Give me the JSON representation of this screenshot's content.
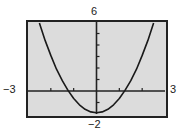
{
  "chart_data": {
    "type": "line",
    "title": "",
    "xlabel": "",
    "ylabel": "",
    "xlim": [
      -3,
      3
    ],
    "ylim": [
      -2,
      6
    ],
    "x_tick_step": 1,
    "y_tick_step": 1,
    "grid": false,
    "legend": null,
    "window_labels": {
      "xmin": "−3",
      "xmax": "3",
      "ymin": "−2",
      "ymax": "6"
    },
    "series": [
      {
        "name": "parabola",
        "description": "Upward-opening parabola, vertex near (0, -1.9), x-intercepts near ±1.23, exits top of window near x = ±2.5",
        "x": [
          -2.5,
          -2.25,
          -2.0,
          -1.75,
          -1.5,
          -1.25,
          -1.0,
          -0.75,
          -0.5,
          -0.25,
          0.0,
          0.25,
          0.5,
          0.75,
          1.0,
          1.25,
          1.5,
          1.75,
          2.0,
          2.25,
          2.5
        ],
        "y": [
          5.9,
          4.4,
          3.1,
          1.9,
          0.9,
          0.05,
          -0.65,
          -1.2,
          -1.59,
          -1.82,
          -1.9,
          -1.82,
          -1.59,
          -1.2,
          -0.65,
          0.05,
          0.9,
          1.9,
          3.1,
          4.4,
          5.9
        ]
      }
    ]
  },
  "colors": {
    "screen_background": "#dcdcdc",
    "frame": "#222222",
    "axis": "#222222",
    "curve": "#1a1a1a"
  }
}
